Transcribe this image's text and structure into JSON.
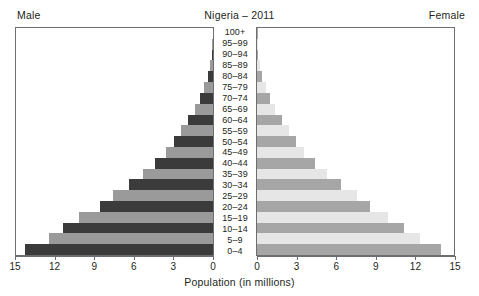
{
  "header": {
    "title": "Nigeria – 2011",
    "male_label": "Male",
    "female_label": "Female"
  },
  "axis": {
    "xlabel": "Population (in millions)",
    "ticks": [
      15,
      12,
      9,
      6,
      3,
      0
    ],
    "ticks_right": [
      0,
      3,
      6,
      9,
      12,
      15
    ],
    "max": 15
  },
  "colors": {
    "male_dark": "#3b3b3b",
    "male_light": "#9a9a9a",
    "female_dark": "#a6a6a6",
    "female_light": "#e6e6e6",
    "frame": "#6d6e71",
    "text": "#231f20"
  },
  "chart_data": {
    "type": "bar",
    "title": "Nigeria – 2011",
    "xlabel": "Population (in millions)",
    "ylabel": "",
    "orientation": "population-pyramid",
    "xlim": [
      0,
      15
    ],
    "grid": false,
    "legend": [
      "Male",
      "Female"
    ],
    "categories": [
      "100+",
      "95–99",
      "90–94",
      "85–89",
      "80–84",
      "75–79",
      "70–74",
      "65–69",
      "60–64",
      "55–59",
      "50–54",
      "45–49",
      "40–44",
      "35–39",
      "30–34",
      "25–29",
      "20–24",
      "15–19",
      "10–14",
      "5–9",
      "0–4"
    ],
    "series": [
      {
        "name": "Male",
        "values": [
          0.02,
          0.05,
          0.1,
          0.2,
          0.4,
          0.7,
          1.0,
          1.4,
          1.9,
          2.4,
          3.0,
          3.6,
          4.4,
          5.3,
          6.4,
          7.6,
          8.6,
          10.2,
          11.4,
          12.5,
          14.3
        ]
      },
      {
        "name": "Female",
        "values": [
          0.02,
          0.05,
          0.1,
          0.2,
          0.4,
          0.7,
          1.0,
          1.4,
          1.9,
          2.4,
          3.0,
          3.6,
          4.4,
          5.3,
          6.4,
          7.6,
          8.6,
          10.0,
          11.2,
          12.4,
          14.0
        ]
      }
    ]
  }
}
